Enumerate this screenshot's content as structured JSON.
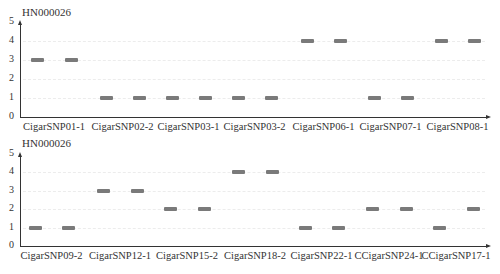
{
  "chart_data": [
    {
      "type": "scatter",
      "title": "HN000026",
      "xlabel": "",
      "ylabel": "",
      "ylim": [
        0,
        5
      ],
      "yticks": [
        "0",
        "1",
        "2",
        "3",
        "4",
        "5"
      ],
      "grid": true,
      "categories": [
        "CigarSNP01-1",
        "CigarSNP02-2",
        "CigarSNP03-1",
        "CigarSNP03-2",
        "CigarSNP06-1",
        "CigarSNP07-1",
        "CigarSNP08-1"
      ],
      "series": [
        {
          "name": "band-1",
          "values": [
            3,
            1,
            1,
            1,
            4,
            1,
            4
          ]
        },
        {
          "name": "band-2",
          "values": [
            3,
            1,
            1,
            1,
            4,
            1,
            4
          ]
        }
      ]
    },
    {
      "type": "scatter",
      "title": "HN000026",
      "xlabel": "",
      "ylabel": "",
      "ylim": [
        0,
        5
      ],
      "yticks": [
        "0",
        "1",
        "2",
        "3",
        "4",
        "5"
      ],
      "grid": true,
      "categories": [
        "CigarSNP09-2",
        "CigarSNP12-1",
        "CigarSNP15-2",
        "CigarSNP18-2",
        "CigarSNP22-1",
        "CCigarSNP24-1",
        "CCigarSNP17-1"
      ],
      "series": [
        {
          "name": "band-1",
          "values": [
            1,
            3,
            2,
            4,
            1,
            2,
            1
          ]
        },
        {
          "name": "band-2",
          "values": [
            1,
            3,
            2,
            4,
            1,
            2,
            2
          ]
        }
      ]
    }
  ],
  "colors": {
    "band": "#7a7a7a",
    "axis": "#333333",
    "grid": "#ececec"
  }
}
